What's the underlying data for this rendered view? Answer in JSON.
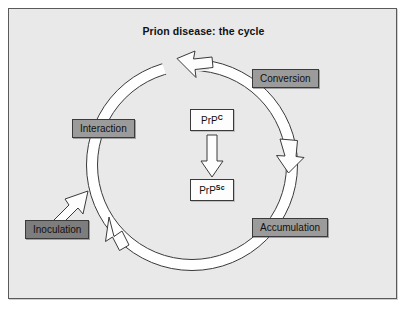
{
  "figure": {
    "title": "Prion disease: the cycle",
    "background_color": "#e9e9e9",
    "border_color": "#5a5a5a"
  },
  "diagram_data": {
    "type": "cycle-diagram",
    "direction": "clockwise-from-interaction",
    "stage_fill": "#9b9b9b",
    "stage_fill_highlight": "#7d7d7d",
    "protein_fill": "#fdfdfd",
    "stages": [
      {
        "id": "interaction",
        "label": "Interaction",
        "angle_deg": 180,
        "fill": "#9b9b9b"
      },
      {
        "id": "conversion",
        "label": "Conversion",
        "angle_deg": 45,
        "fill": "#9b9b9b"
      },
      {
        "id": "accumulation",
        "label": "Accumulation",
        "angle_deg": 315,
        "fill": "#9b9b9b"
      },
      {
        "id": "inoculation",
        "label": "Inoculation",
        "angle_deg": 215,
        "fill": "#7d7d7d",
        "external": true
      }
    ],
    "proteins": [
      {
        "id": "prpc",
        "base": "PrP",
        "superscript": "C"
      },
      {
        "id": "prpsc",
        "base": "PrP",
        "superscript": "Sc"
      }
    ],
    "conversion_arrow": {
      "from": "prpc",
      "to": "prpsc",
      "style": "hollow-block-arrow",
      "direction": "down"
    },
    "ring_arrowheads": [
      {
        "at": "top",
        "points": "counterclockwise-left"
      },
      {
        "at": "right",
        "points": "down"
      },
      {
        "at": "bottom-left",
        "points": "up-left"
      },
      {
        "at": "inoculation",
        "points": "up-right",
        "style": "straight-hollow-arrow"
      }
    ]
  },
  "labels": {
    "conversion": "Conversion",
    "accumulation": "Accumulation",
    "interaction": "Interaction",
    "inoculation": "Inoculation",
    "prpc_base": "PrP",
    "prpc_sup": "C",
    "prpsc_base": "PrP",
    "prpsc_sup": "Sc"
  }
}
